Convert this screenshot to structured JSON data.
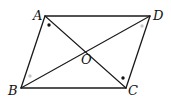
{
  "diagram": {
    "type": "geometry",
    "shape": "parallelogram",
    "vertices": {
      "A": {
        "label": "A",
        "x": 45,
        "y": 16,
        "label_x": 33,
        "label_y": 20
      },
      "D": {
        "label": "D",
        "x": 150,
        "y": 16,
        "label_x": 153,
        "label_y": 20
      },
      "C": {
        "label": "C",
        "x": 126,
        "y": 88,
        "label_x": 128,
        "label_y": 95
      },
      "B": {
        "label": "B",
        "x": 21,
        "y": 88,
        "label_x": 8,
        "label_y": 95
      }
    },
    "center": {
      "label": "O",
      "x": 86,
      "y": 52,
      "label_x": 81,
      "label_y": 64
    },
    "edges": [
      [
        "A",
        "D"
      ],
      [
        "D",
        "C"
      ],
      [
        "C",
        "B"
      ],
      [
        "B",
        "A"
      ]
    ],
    "diagonals": [
      [
        "A",
        "C"
      ],
      [
        "B",
        "D"
      ]
    ],
    "angle_marks": [
      {
        "at": "A",
        "angle": "BAC",
        "style": "black-dot",
        "x": 49,
        "y": 25,
        "color": "#111111"
      },
      {
        "at": "C",
        "angle": "ACD",
        "style": "black-dot",
        "x": 123,
        "y": 78,
        "color": "#111111"
      },
      {
        "at": "D",
        "angle": "ADB",
        "style": "gray-dot",
        "x": 142,
        "y": 26,
        "color": "#c8c8c8"
      },
      {
        "at": "B",
        "angle": "CBD",
        "style": "gray-dot",
        "x": 30,
        "y": 76,
        "color": "#c8c8c8"
      }
    ]
  }
}
